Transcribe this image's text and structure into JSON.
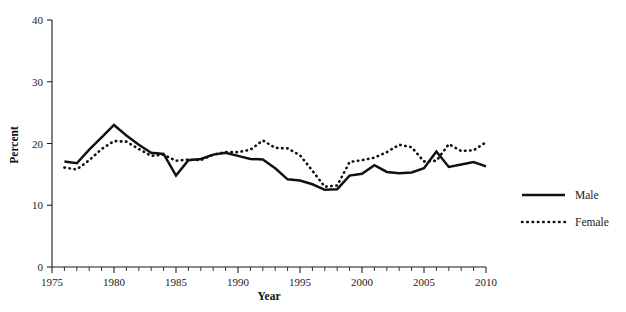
{
  "chart_data": {
    "type": "line",
    "title": "",
    "xlabel": "Year",
    "ylabel": "Percent",
    "xlim": [
      1975,
      2010
    ],
    "ylim": [
      0,
      40
    ],
    "grid": false,
    "legend_position": "right",
    "y_ticks": [
      0,
      10,
      20,
      30,
      40
    ],
    "y_tick_labels": [
      "0",
      "10",
      "20",
      "30",
      "40"
    ],
    "x_ticks": [
      1975,
      1980,
      1985,
      1990,
      1995,
      2000,
      2005,
      2010
    ],
    "x_tick_labels": [
      "1975",
      "1980",
      "1985",
      "1990",
      "1995",
      "2000",
      "2005",
      "2010"
    ],
    "x_minor_tick_step": 1,
    "x": [
      1976,
      1977,
      1978,
      1979,
      1980,
      1981,
      1982,
      1983,
      1984,
      1985,
      1986,
      1987,
      1988,
      1989,
      1990,
      1991,
      1992,
      1993,
      1994,
      1995,
      1996,
      1997,
      1998,
      1999,
      2000,
      2001,
      2002,
      2003,
      2004,
      2005,
      2006,
      2007,
      2008,
      2009,
      2010
    ],
    "series": [
      {
        "name": "Male",
        "style": "solid",
        "color": "#111111",
        "values": [
          17.1,
          16.8,
          19.0,
          21.0,
          23.0,
          21.3,
          19.8,
          18.5,
          18.3,
          14.8,
          17.3,
          17.5,
          18.2,
          18.5,
          18.0,
          17.5,
          17.4,
          16.0,
          14.2,
          14.0,
          13.4,
          12.5,
          12.6,
          14.8,
          15.1,
          16.5,
          15.4,
          15.2,
          15.3,
          16.0,
          18.7,
          16.2,
          16.6,
          17.0,
          16.3
        ]
      },
      {
        "name": "Female",
        "style": "dotted",
        "color": "#111111",
        "values": [
          16.1,
          15.8,
          17.3,
          19.1,
          20.4,
          20.3,
          19.1,
          18.0,
          18.2,
          17.2,
          17.4,
          17.3,
          18.2,
          18.6,
          18.6,
          19.0,
          20.5,
          19.3,
          19.2,
          18.1,
          15.6,
          13.0,
          13.2,
          17.0,
          17.3,
          17.7,
          18.6,
          19.8,
          19.4,
          17.1,
          17.2,
          19.9,
          18.8,
          18.9,
          20.2
        ]
      }
    ],
    "legend": [
      {
        "label": "Male",
        "style": "solid"
      },
      {
        "label": "Female",
        "style": "dotted"
      }
    ]
  }
}
